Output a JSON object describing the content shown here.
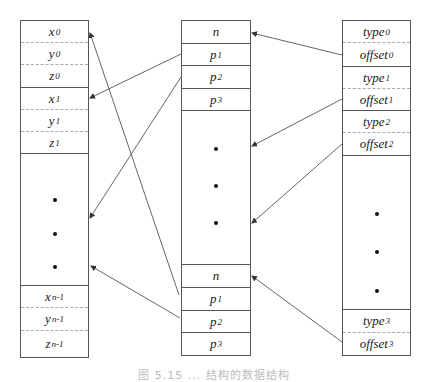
{
  "diagram": {
    "left_box": {
      "cells": [
        {
          "base": "x",
          "sub": "0"
        },
        {
          "base": "y",
          "sub": "0"
        },
        {
          "base": "z",
          "sub": "0"
        },
        {
          "base": "x",
          "sub": "1"
        },
        {
          "base": "y",
          "sub": "1"
        },
        {
          "base": "z",
          "sub": "1"
        },
        {
          "base": "x",
          "sub": "n-1"
        },
        {
          "base": "y",
          "sub": "n-1"
        },
        {
          "base": "z",
          "sub": "n-1"
        }
      ]
    },
    "middle_box": {
      "cells": [
        {
          "base": "n",
          "sub": ""
        },
        {
          "base": "p",
          "sub": "1"
        },
        {
          "base": "p",
          "sub": "2"
        },
        {
          "base": "p",
          "sub": "3"
        },
        {
          "base": "n",
          "sub": ""
        },
        {
          "base": "p",
          "sub": "1"
        },
        {
          "base": "p",
          "sub": "2"
        },
        {
          "base": "p",
          "sub": "3"
        }
      ]
    },
    "right_box": {
      "cells": [
        {
          "base": "type",
          "sub": "0"
        },
        {
          "base": "offset",
          "sub": "0"
        },
        {
          "base": "type",
          "sub": "1"
        },
        {
          "base": "offset",
          "sub": "1"
        },
        {
          "base": "type",
          "sub": "2"
        },
        {
          "base": "offset",
          "sub": "2"
        },
        {
          "base": "type",
          "sub": "3"
        },
        {
          "base": "offset",
          "sub": "3"
        }
      ]
    },
    "ellipsis_symbol": "•",
    "edge_color": "#555555",
    "caption": "图 5.15 ... 结构的数据结构"
  }
}
